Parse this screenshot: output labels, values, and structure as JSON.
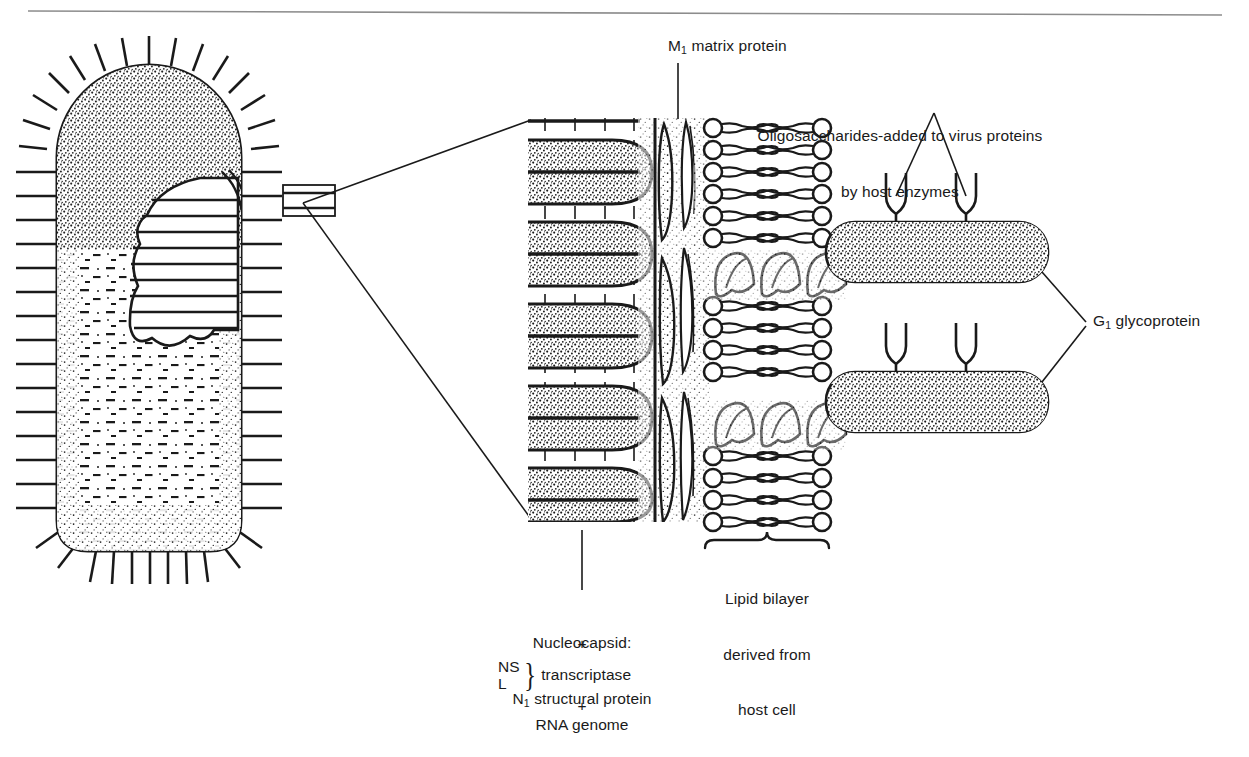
{
  "figure": {
    "background_color": "#ffffff",
    "ink_color": "#1a1a1a",
    "header_rule_color": "#8c8c8c"
  },
  "labels": {
    "m1_matrix_protein": {
      "prefix": "M",
      "sub": "1",
      "suffix": " matrix protein"
    },
    "oligosaccharides_line1": "Oligosaccharides-added to virus proteins",
    "oligosaccharides_line2": "by host enzymes",
    "g1_glycoprotein": {
      "prefix": "G",
      "sub": "1",
      "suffix": " glycoprotein"
    },
    "lipid_bilayer_line1": "Lipid bilayer",
    "lipid_bilayer_line2": "derived from",
    "lipid_bilayer_line3": "host cell",
    "nucleocapsid_line1": "Nucleocapsid:",
    "nucleocapsid_line2": {
      "prefix": "N",
      "sub": "1",
      "suffix": " structural protein"
    },
    "plus_one": "+",
    "transcriptase_top": "NS",
    "transcriptase_bottom": "L",
    "transcriptase_brace": "}",
    "transcriptase_label": "transcriptase",
    "plus_two": "+",
    "rna_genome": "RNA genome"
  },
  "parts": {
    "virion": {
      "name": "bullet-shaped-virus-particle",
      "description": "Stippled bullet-shaped enveloped virion with surface spikes and cutaway revealing coiled nucleocapsid"
    },
    "callout": {
      "name": "magnification-callout",
      "description": "Small rectangle on virion envelope with two leader lines fanning to the enlarged detail panel"
    },
    "detail_panel": {
      "nucleocapsid_coils": "Coiled ribonucleoprotein helix turns, stippled with cross-striations",
      "matrix_layer": "Tapered spindle-shaped matrix protein subunits lining the inner envelope face",
      "lipid_bilayer": "Two leaflets of phospholipids: circular head groups with wavy hydrocarbon tails",
      "transmembrane_helices": "Helical membrane-spanning segments of the glycoprotein",
      "glycoprotein_ectodomains": "Two stippled rod-shaped glycoprotein spikes projecting outward",
      "oligosaccharide_glycans": "Four Y-shaped branched oligosaccharide chains on the glycoprotein rods"
    }
  },
  "counts": {
    "nucleocapsid_coil_turns": 5,
    "glycoprotein_spikes": 2,
    "oligosaccharide_branches_per_spike": 2,
    "bilayer_leaflets": 2
  }
}
